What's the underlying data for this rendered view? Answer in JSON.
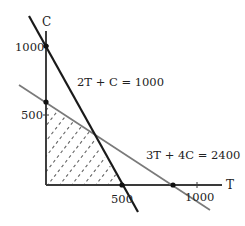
{
  "diagram": {
    "type": "linear-programming-feasible-region",
    "axes": {
      "x_label": "T",
      "y_label": "C",
      "x_ticks": [
        "500",
        "1000"
      ],
      "y_ticks": [
        "500",
        "1000"
      ]
    },
    "constraints": [
      {
        "label": "2T + C = 1000",
        "color": "#1a1a1a",
        "intercepts": {
          "T": 500,
          "C": 1000
        }
      },
      {
        "label": "3T + 4C = 2400",
        "color": "#7a7a7a",
        "intercepts": {
          "T": 800,
          "C": 600
        }
      }
    ],
    "feasible_region": {
      "vertices": [
        [
          0,
          0
        ],
        [
          0,
          600
        ],
        [
          320,
          360
        ],
        [
          500,
          0
        ]
      ],
      "fill": "dashed-hatch"
    },
    "colors": {
      "axis": "#3a3a3a",
      "hatch": "#555555",
      "steep_line": "#1a1a1a",
      "shallow_line": "#7a7a7a"
    }
  }
}
